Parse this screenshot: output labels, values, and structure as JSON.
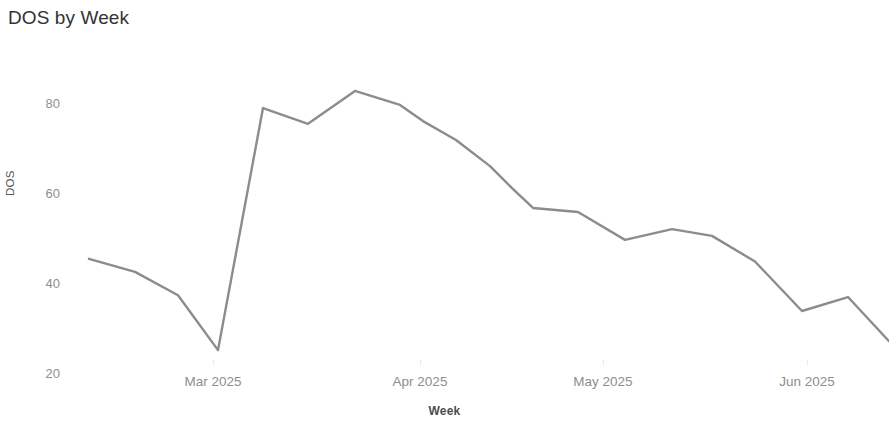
{
  "chart_data": {
    "type": "line",
    "title": "DOS by Week",
    "xlabel": "Week",
    "ylabel": "DOS",
    "grid": false,
    "legend": "none",
    "line_color": "#8c8c8c",
    "text_color": "#8e8e8e",
    "title_color": "#333333",
    "background_color": "#ffffff",
    "ylim": [
      17,
      85
    ],
    "yticks": [
      20,
      40,
      60,
      80
    ],
    "ytick_labels": [
      "20",
      "40",
      "60",
      "80"
    ],
    "xtick_labels": [
      "Mar 2025",
      "Apr 2025",
      "May 2025",
      "Jun 2025"
    ],
    "xtick_positions_px": [
      213,
      420,
      603,
      807
    ],
    "x": [
      "2025-02-02",
      "2025-02-09",
      "2025-02-16",
      "2025-02-23",
      "2025-03-02",
      "2025-03-09",
      "2025-03-16",
      "2025-03-23",
      "2025-03-30",
      "2025-04-06",
      "2025-04-13",
      "2025-04-20",
      "2025-04-27",
      "2025-05-04",
      "2025-05-11",
      "2025-05-18",
      "2025-05-25",
      "2025-06-01",
      "2025-06-08",
      "2025-06-15",
      "2025-06-22"
    ],
    "values": [
      45.6,
      42.7,
      37.5,
      25.3,
      79.1,
      75.6,
      82.9,
      79.8,
      76.2,
      72.0,
      66.2,
      61.3,
      56.9,
      56.0,
      49.8,
      52.2,
      50.7,
      45.0,
      34.0,
      37.1,
      27.3
    ],
    "points_px": [
      [
        89,
        259
      ],
      [
        135,
        272
      ],
      [
        178,
        310
      ],
      [
        218,
        350
      ],
      [
        263,
        108
      ],
      [
        308,
        124
      ],
      [
        355,
        91
      ],
      [
        400,
        105
      ],
      [
        423,
        121
      ],
      [
        456,
        140
      ],
      [
        490,
        166
      ],
      [
        512,
        188
      ],
      [
        533,
        208
      ],
      [
        578,
        212
      ],
      [
        625,
        240
      ],
      [
        672,
        231
      ],
      [
        712,
        238
      ],
      [
        755,
        262
      ],
      [
        802,
        311
      ],
      [
        848,
        297
      ],
      [
        889,
        341
      ]
    ]
  }
}
